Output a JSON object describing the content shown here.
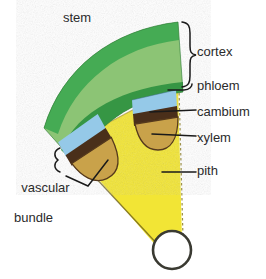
{
  "figure": {
    "labels": {
      "stem": "stem",
      "cortex": "cortex",
      "phloem": "phloem",
      "cambium": "cambium",
      "xylem": "xylem",
      "pith": "pith",
      "vascular_bundle_line1": "vascular",
      "vascular_bundle_line2": "bundle"
    },
    "colors": {
      "background": "#ffffff",
      "cortex_fill": "#8cc474",
      "cortex_edge_outer": "#3aa14a",
      "cortex_edge_inner": "#2e8b3d",
      "phloem": "#95c9e8",
      "cambium": "#4a2f1a",
      "xylem": "#c9a24a",
      "pith": "#f2e535",
      "pith_outline": "#8a7a20",
      "label_text": "#2b2b2b",
      "leader_line": "#1a1a1a",
      "circle_fill": "#ffffff",
      "circle_stroke": "#3a3a32"
    },
    "structures": [
      {
        "name": "cortex",
        "region": "outer green band"
      },
      {
        "name": "phloem",
        "region": "light blue cap of vascular bundle"
      },
      {
        "name": "cambium",
        "region": "dark brown band between phloem and xylem"
      },
      {
        "name": "xylem",
        "region": "tan lobe below cambium"
      },
      {
        "name": "pith",
        "region": "yellow central wedge"
      },
      {
        "name": "vascular bundle",
        "region": "phloem + cambium + xylem unit"
      }
    ],
    "bundle_count": 2
  }
}
